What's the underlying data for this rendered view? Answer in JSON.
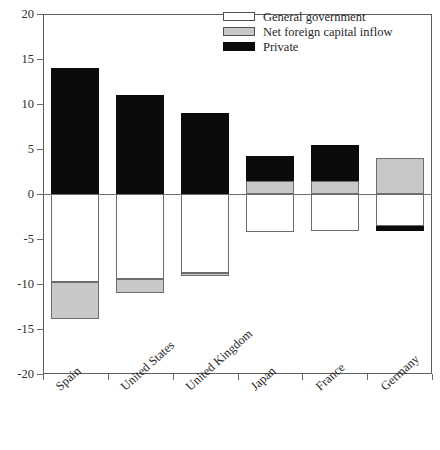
{
  "chart_data": {
    "type": "bar",
    "stacked": true,
    "title": "",
    "subtitle": "",
    "xlabel": "",
    "ylabel": "",
    "ylim": [
      -20,
      20
    ],
    "yticks": [
      20,
      15,
      10,
      5,
      0,
      -5,
      -10,
      -15,
      -20
    ],
    "ytick_labels": [
      "20",
      "15",
      "10",
      "5",
      "0",
      "-5",
      "-10",
      "-15",
      "-20"
    ],
    "grid": false,
    "legend_position": "top-right",
    "categories": [
      "Spain",
      "United States",
      "United Kingdom",
      "Japan",
      "France",
      "Germany"
    ],
    "series": [
      {
        "name": "General government",
        "color": "#ffffff",
        "values": [
          -9.8,
          -9.4,
          -8.8,
          -4.2,
          -4.1,
          -3.6
        ]
      },
      {
        "name": "Net foreign capital inflow",
        "color": "#c8c8c8",
        "values": [
          -4.1,
          -1.6,
          -0.3,
          1.4,
          1.4,
          4.0
        ]
      },
      {
        "name": "Private",
        "color": "#0b0b0b",
        "values": [
          14.0,
          11.0,
          9.0,
          2.8,
          4.0,
          -0.5
        ]
      }
    ],
    "totals_positive": [
      14.0,
      11.0,
      9.0,
      4.2,
      5.4,
      4.0
    ],
    "totals_negative": [
      -13.9,
      -11.0,
      -9.1,
      -4.2,
      -4.1,
      -4.1
    ]
  },
  "legend": {
    "items": [
      {
        "label": "General government",
        "swatch": "white-swatch"
      },
      {
        "label": "Net foreign capital inflow",
        "swatch": "gray-swatch"
      },
      {
        "label": "Private",
        "swatch": "black-swatch"
      }
    ]
  },
  "axes": {
    "y": {
      "ticks": [
        "20",
        "15",
        "10",
        "5",
        "0",
        "-5",
        "-10",
        "-15",
        "-20"
      ]
    },
    "x": {
      "ticks": [
        "Spain",
        "United States",
        "United Kingdom",
        "Japan",
        "France",
        "Germany"
      ]
    }
  }
}
